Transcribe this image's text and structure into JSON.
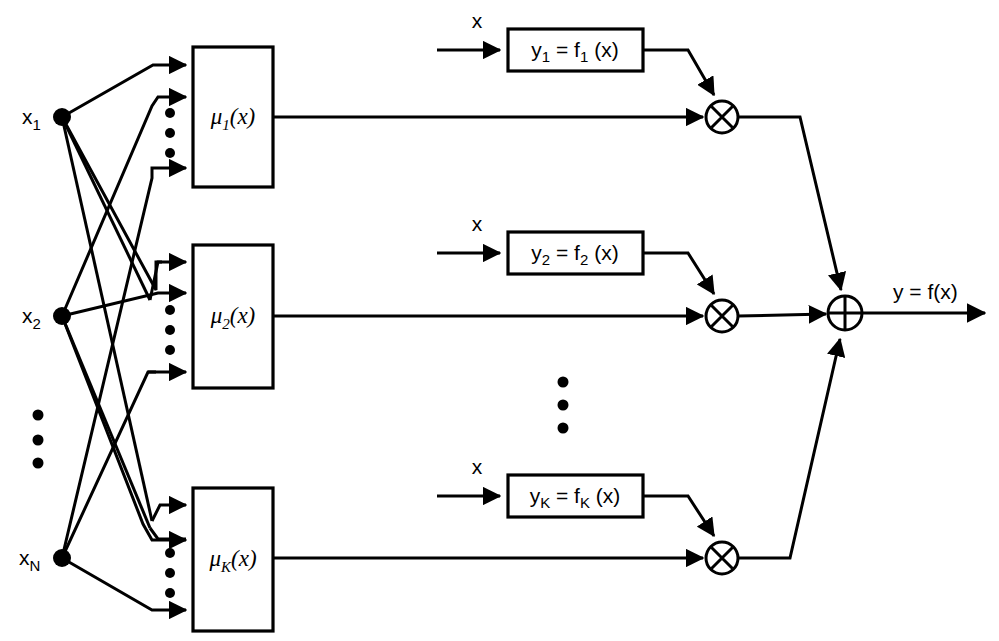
{
  "diagram": {
    "background_color": "#ffffff",
    "line_color": "#000000",
    "inputs": [
      {
        "id": "x1",
        "base": "x",
        "sub": "1",
        "cx": 62,
        "cy": 117
      },
      {
        "id": "x2",
        "base": "x",
        "sub": "2",
        "cx": 62,
        "cy": 316
      },
      {
        "id": "xN",
        "base": "x",
        "sub": "N",
        "cx": 62,
        "cy": 558
      }
    ],
    "input_vertical_ellipsis": {
      "cx": 38,
      "ys": [
        415,
        440,
        463
      ]
    },
    "membership_blocks": [
      {
        "id": "mu1",
        "base": "μ",
        "sub": "1",
        "tail": "(x)",
        "x": 193,
        "y": 47,
        "w": 80,
        "h": 140
      },
      {
        "id": "mu2",
        "base": "μ",
        "sub": "2",
        "tail": "(x)",
        "x": 193,
        "y": 245,
        "w": 80,
        "h": 143
      },
      {
        "id": "muK",
        "base": "μ",
        "sub": "K",
        "tail": "(x)",
        "x": 193,
        "y": 488,
        "w": 80,
        "h": 143
      }
    ],
    "membership_input_ellipses": [
      {
        "cx": 170,
        "ys": [
          113,
          133,
          153
        ]
      },
      {
        "cx": 170,
        "ys": [
          310,
          330,
          350
        ]
      },
      {
        "cx": 170,
        "ys": [
          553,
          573,
          593
        ]
      }
    ],
    "expert_blocks": [
      {
        "id": "f1",
        "y_label": "y",
        "y_sub": "1",
        "eq": " = f",
        "f_sub": "1",
        "tail": " (x)",
        "x": 508,
        "y": 29,
        "w": 135,
        "h": 42,
        "input_label": "x",
        "input_label_x": 477,
        "input_label_y": 22
      },
      {
        "id": "f2",
        "y_label": "y",
        "y_sub": "2",
        "eq": " = f",
        "f_sub": "2",
        "tail": " (x)",
        "x": 508,
        "y": 232,
        "w": 135,
        "h": 42,
        "input_label": "x",
        "input_label_x": 477,
        "input_label_y": 225
      },
      {
        "id": "fK",
        "y_label": "y",
        "y_sub": "K",
        "eq": " = f",
        "f_sub": "K",
        "tail": " (x)",
        "x": 508,
        "y": 475,
        "w": 135,
        "h": 42,
        "input_label": "x",
        "input_label_x": 477,
        "input_label_y": 468
      }
    ],
    "expert_vertical_ellipsis": {
      "cx": 563,
      "ys": [
        382,
        405,
        428
      ]
    },
    "multiply_nodes": [
      {
        "id": "mult1",
        "symbol": "⊗",
        "cx": 722,
        "cy": 117,
        "r": 16
      },
      {
        "id": "mult2",
        "symbol": "⊗",
        "cx": 722,
        "cy": 316,
        "r": 16
      },
      {
        "id": "multK",
        "symbol": "⊗",
        "cx": 722,
        "cy": 558,
        "r": 16
      }
    ],
    "sum_node": {
      "id": "sum",
      "symbol": "⊕",
      "cx": 845,
      "cy": 313,
      "r": 17
    },
    "output": {
      "label": "y = f(x)",
      "label_x": 893,
      "label_y": 297,
      "arrow_from_x": 862,
      "arrow_to_x": 985,
      "y": 313
    }
  }
}
